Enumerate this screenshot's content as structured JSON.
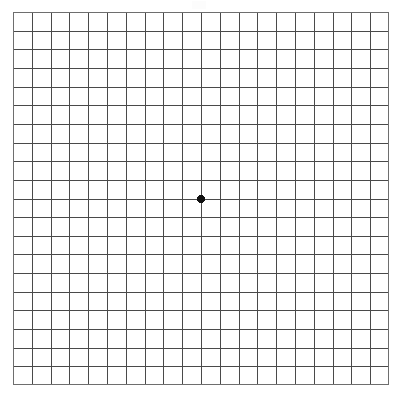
{
  "document": {
    "title": "Amsler Grid",
    "type": "amsler-grid-eye-test-chart"
  },
  "chart_data": {
    "type": "grid",
    "columns": 20,
    "rows": 20,
    "cell_size_px": 18.8,
    "grid_left_px": 13,
    "grid_top_px": 12,
    "grid_width_px": 376,
    "grid_height_px": 373,
    "line_color": "#4a4a4a",
    "border_color": "#6e6e6e",
    "background_color": "#ffffff",
    "fixation_dot": {
      "label": "central fixation dot",
      "x_px": 202,
      "y_px": 198,
      "grid_col": 10,
      "grid_row": 10,
      "diameter_px": 8,
      "color": "#111111"
    }
  },
  "colors": {
    "background": "#ffffff",
    "grid_line": "#4a4a4a",
    "grid_border": "#6e6e6e",
    "dot": "#111111"
  }
}
